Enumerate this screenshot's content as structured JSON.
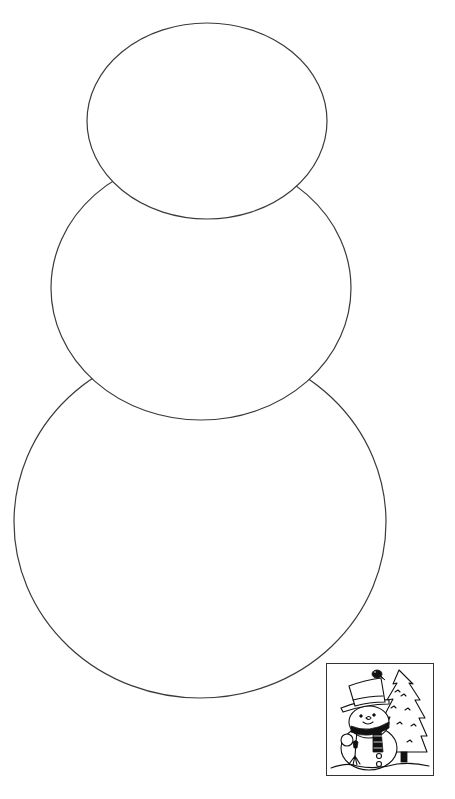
{
  "page": {
    "background_color": "#ffffff",
    "outline_color": "#3a3a3a"
  },
  "snowman_template": {
    "parts": [
      {
        "name": "bottom-body",
        "cx": 200,
        "cy": 522,
        "rx": 186,
        "ry": 176
      },
      {
        "name": "middle-body",
        "cx": 201,
        "cy": 288,
        "rx": 150,
        "ry": 132
      },
      {
        "name": "head",
        "cx": 207,
        "cy": 121,
        "rx": 120,
        "ry": 98
      }
    ]
  },
  "preview": {
    "label": "Finished snowman preview",
    "frame": {
      "x": 326,
      "y": 663,
      "width": 108,
      "height": 113
    },
    "elements": [
      "top-hat",
      "bird",
      "scarf",
      "buttons",
      "broom",
      "pine-tree",
      "snow-ground"
    ]
  }
}
